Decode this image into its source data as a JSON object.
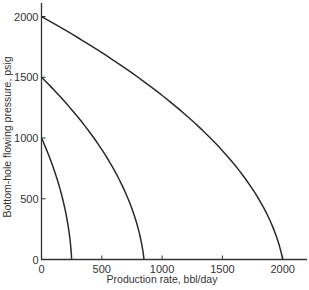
{
  "chart_data": {
    "type": "line",
    "title": "",
    "xlabel": "Production rate, bbl/day",
    "ylabel": "Bottom-hole flowing pressure, psig",
    "xlim": [
      0,
      2200
    ],
    "ylim": [
      0,
      2100
    ],
    "xticks": [
      0,
      500,
      1000,
      1500,
      2000
    ],
    "yticks": [
      0,
      500,
      1000,
      1500,
      2000
    ],
    "xtick_labels": [
      "0",
      "500",
      "1000",
      "1500",
      "2000"
    ],
    "ytick_labels": [
      "0",
      "500",
      "1000",
      "1500",
      "2000"
    ],
    "grid": false,
    "legend": null,
    "series": [
      {
        "name": "IPR, reservoir pressure 1000 psig",
        "reservoir_pressure": 1000,
        "qmax": 250,
        "x": [
          0,
          45,
          90,
          130,
          170,
          205,
          235,
          250
        ],
        "y": [
          1000,
          900,
          780,
          650,
          500,
          330,
          150,
          0
        ]
      },
      {
        "name": "IPR, reservoir pressure 1500 psig",
        "reservoir_pressure": 1500,
        "qmax": 850,
        "x": [
          0,
          155,
          320,
          465,
          595,
          715,
          800,
          850
        ],
        "y": [
          1500,
          1350,
          1170,
          980,
          760,
          500,
          250,
          0
        ]
      },
      {
        "name": "IPR, reservoir pressure 2000 psig",
        "reservoir_pressure": 2000,
        "qmax": 2000,
        "x": [
          0,
          380,
          800,
          1180,
          1520,
          1790,
          1950,
          2000
        ],
        "y": [
          2000,
          1800,
          1500,
          1200,
          850,
          480,
          170,
          0
        ]
      }
    ]
  }
}
